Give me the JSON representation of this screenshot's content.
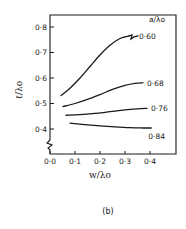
{
  "chart_data": {
    "type": "line",
    "title": "",
    "caption": "(b)",
    "xlabel": "w/λo",
    "ylabel": "ℓ/λo",
    "legend_title": "a/λo",
    "legend_placement": "right (inline labels at curve ends)",
    "xlim": [
      0.0,
      0.5
    ],
    "ylim": [
      0.33,
      0.82
    ],
    "y_axis_break": true,
    "grid": false,
    "x_ticks": [
      0.0,
      0.1,
      0.2,
      0.3,
      0.4
    ],
    "x_tick_labels": [
      "0·0",
      "0·1",
      "0·2",
      "0·3",
      "0·4"
    ],
    "y_ticks": [
      0.4,
      0.5,
      0.6,
      0.7,
      0.8
    ],
    "y_tick_labels": [
      "0·4",
      "0·5",
      "0·6",
      "0·7",
      "0·8"
    ],
    "series": [
      {
        "name": "0·60",
        "x": [
          0.044,
          0.08,
          0.12,
          0.16,
          0.2,
          0.24,
          0.28,
          0.316
        ],
        "y": [
          0.531,
          0.56,
          0.6,
          0.645,
          0.69,
          0.728,
          0.755,
          0.765
        ],
        "end_break": true
      },
      {
        "name": "0·68",
        "x": [
          0.052,
          0.1,
          0.15,
          0.2,
          0.25,
          0.3,
          0.34,
          0.372
        ],
        "y": [
          0.488,
          0.5,
          0.516,
          0.535,
          0.555,
          0.571,
          0.579,
          0.581
        ]
      },
      {
        "name": "0·76",
        "x": [
          0.064,
          0.12,
          0.18,
          0.24,
          0.3,
          0.35,
          0.388
        ],
        "y": [
          0.454,
          0.456,
          0.461,
          0.468,
          0.475,
          0.479,
          0.481
        ]
      },
      {
        "name": "0·84",
        "x": [
          0.08,
          0.14,
          0.2,
          0.26,
          0.32,
          0.37,
          0.405
        ],
        "y": [
          0.423,
          0.417,
          0.412,
          0.408,
          0.405,
          0.404,
          0.404
        ]
      }
    ]
  }
}
